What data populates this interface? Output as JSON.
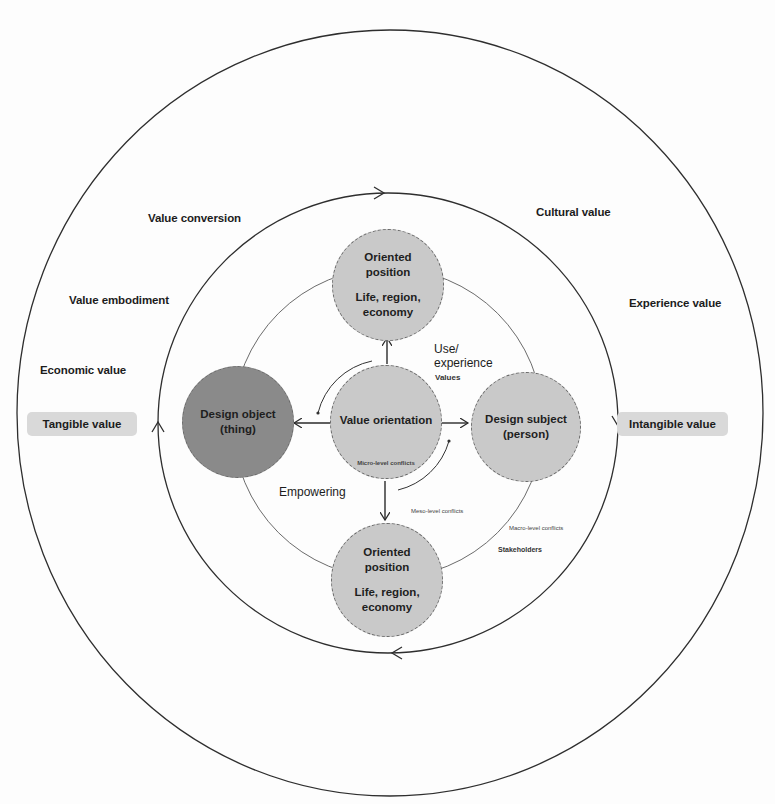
{
  "diagram": {
    "colors": {
      "background": "#fdfdfd",
      "line": "#3a3a3a",
      "node_light": "#c9c9c9",
      "node_dark": "#8a8a8a",
      "pill": "#d9d9d9"
    },
    "outer_ring_labels": {
      "value_conversion": "Value conversion",
      "value_embodiment": "Value embodiment",
      "economic_value": "Economic value",
      "cultural_value": "Cultural value",
      "experience_value": "Experience value"
    },
    "side_pills": {
      "left": "Tangible value",
      "right": "Intangible value"
    },
    "nodes": {
      "top": {
        "title_line1": "Oriented",
        "title_line2": "position",
        "sub_line1": "Life, region,",
        "sub_line2": "economy"
      },
      "center": {
        "title": "Value orientation",
        "note": "Micro-level conflicts"
      },
      "left": {
        "line1": "Design object",
        "line2": "(thing)"
      },
      "right": {
        "line1": "Design subject",
        "line2": "(person)"
      },
      "bottom": {
        "title_line1": "Oriented",
        "title_line2": "position",
        "sub_line1": "Life, region,",
        "sub_line2": "economy"
      }
    },
    "inner_labels": {
      "use_experience_line1": "Use/",
      "use_experience_line2": "experience",
      "values": "Values",
      "empowering": "Empowering",
      "meso_conflicts": "Meso-level conflicts",
      "macro_conflicts": "Macro-level conflicts",
      "stakeholders": "Stakeholders"
    }
  }
}
